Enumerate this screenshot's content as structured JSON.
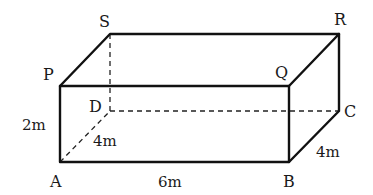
{
  "figure": {
    "type": "cuboid",
    "vertices": {
      "A": {
        "label": "A"
      },
      "B": {
        "label": "B"
      },
      "C": {
        "label": "C"
      },
      "D": {
        "label": "D"
      },
      "P": {
        "label": "P"
      },
      "Q": {
        "label": "Q"
      },
      "R": {
        "label": "R"
      },
      "S": {
        "label": "S"
      }
    },
    "dimensions": {
      "height_AP": "2m",
      "length_AB": "6m",
      "width_AD": "4m",
      "width_BC": "4m"
    },
    "hidden_edges": [
      "AD",
      "DC",
      "DS"
    ]
  }
}
